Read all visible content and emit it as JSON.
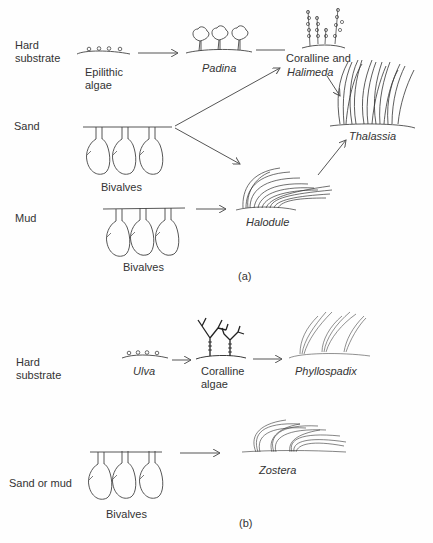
{
  "panel_a": {
    "caption": "(a)",
    "rows": {
      "hard_substrate": "Hard\nsubstrate",
      "sand": "Sand",
      "mud": "Mud"
    },
    "taxa": {
      "epilithic_algae": "Epilithic\nalgae",
      "padina": "Padina",
      "coralline_halimeda_1": "Coralline and",
      "coralline_halimeda_2": "Halimeda",
      "thalassia": "Thalassia",
      "bivalves_sand": "Bivalves",
      "bivalves_mud": "Bivalves",
      "halodule": "Halodule"
    }
  },
  "panel_b": {
    "caption": "(b)",
    "rows": {
      "hard_substrate": "Hard\nsubstrate",
      "sand_or_mud": "Sand or mud"
    },
    "taxa": {
      "ulva": "Ulva",
      "coralline_algae": "Coralline\nalgae",
      "phyllospadix": "Phyllospadix",
      "bivalves": "Bivalves",
      "zostera": "Zostera"
    }
  }
}
